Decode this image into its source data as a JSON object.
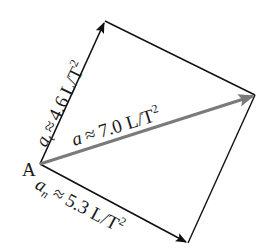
{
  "diagram": {
    "type": "vector-decomposition",
    "point_label": "A",
    "points": {
      "A": [
        40,
        164
      ],
      "top": [
        105,
        21
      ],
      "right": [
        255,
        95
      ],
      "bottom": [
        188,
        243
      ]
    },
    "vectors": [
      {
        "id": "a_t",
        "symbol": "a",
        "subscript": "t",
        "approx": "≈",
        "value": "4.6",
        "unit": "L/T",
        "exponent": "2",
        "from": "A",
        "to": "top",
        "color": "#111111"
      },
      {
        "id": "a",
        "symbol": "a",
        "subscript": "",
        "approx": "≈",
        "value": "7.0",
        "unit": "L/T",
        "exponent": "2",
        "from": "A",
        "to": "right",
        "color": "#7a7a7a"
      },
      {
        "id": "a_n",
        "symbol": "a",
        "subscript": "n",
        "approx": "≈",
        "value": "5.3",
        "unit": "L/T",
        "exponent": "2",
        "from": "A",
        "to": "bottom",
        "color": "#111111"
      }
    ],
    "edges": [
      {
        "from": "top",
        "to": "right",
        "color": "#111111"
      },
      {
        "from": "right",
        "to": "bottom",
        "color": "#111111"
      }
    ]
  }
}
